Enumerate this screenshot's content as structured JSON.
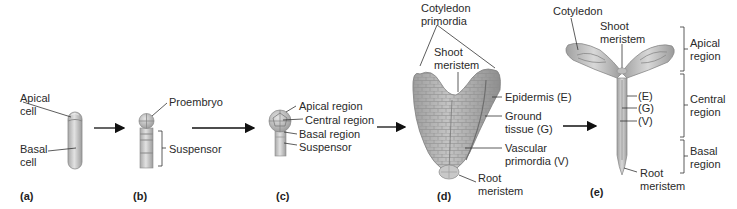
{
  "panels": [
    {
      "id": "a",
      "label": "(a)",
      "labels": {
        "apical_cell": "Apical\ncell",
        "basal_cell": "Basal\ncell"
      }
    },
    {
      "id": "b",
      "label": "(b)",
      "labels": {
        "proembryo": "Proembryo",
        "suspensor": "Suspensor"
      }
    },
    {
      "id": "c",
      "label": "(c)",
      "labels": {
        "apical_region": "Apical region",
        "central_region": "Central region",
        "basal_region": "Basal region",
        "suspensor": "Suspensor"
      }
    },
    {
      "id": "d",
      "label": "(d)",
      "labels": {
        "cotyledon_primordia": "Cotyledon\nprimordia",
        "shoot_meristem": "Shoot\nmeristem",
        "epidermis": "Epidermis (E)",
        "ground_tissue": "Ground\ntissue (G)",
        "vascular_primordia": "Vascular\nprimordia (V)",
        "root_meristem": "Root\nmeristem"
      }
    },
    {
      "id": "e",
      "label": "(e)",
      "labels": {
        "cotyledon": "Cotyledon",
        "shoot_meristem": "Shoot\nmeristem",
        "e": "(E)",
        "g": "(G)",
        "v": "(V)",
        "root_meristem": "Root\nmeristem",
        "apical_region": "Apical\nregion",
        "central_region": "Central\nregion",
        "basal_region": "Basal\nregion"
      }
    }
  ],
  "colors": {
    "tissue_fill": "#c9c9c9",
    "tissue_stroke": "#8a8a8a",
    "band": "#9a9a9a",
    "leader": "#333333",
    "arrow": "#111111"
  }
}
